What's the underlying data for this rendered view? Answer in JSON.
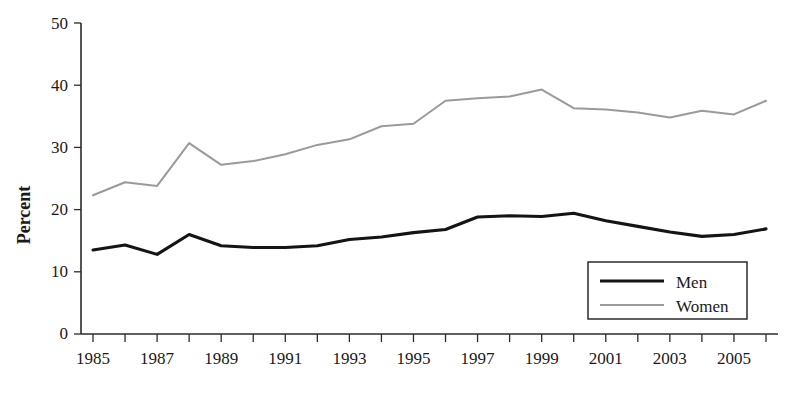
{
  "chart_data": {
    "type": "line",
    "title": "",
    "xlabel": "",
    "ylabel": "Percent",
    "x": [
      1985,
      1986,
      1987,
      1988,
      1989,
      1990,
      1991,
      1992,
      1993,
      1994,
      1995,
      1996,
      1997,
      1998,
      1999,
      2000,
      2001,
      2002,
      2003,
      2004,
      2005,
      2006
    ],
    "xlim": [
      1985,
      2006
    ],
    "ylim": [
      0,
      50
    ],
    "ytick_labels": [
      "0",
      "10",
      "20",
      "30",
      "40",
      "50"
    ],
    "yticks": [
      0,
      10,
      20,
      30,
      40,
      50
    ],
    "xtick_labels": [
      "1985",
      "1987",
      "1989",
      "1991",
      "1993",
      "1995",
      "1997",
      "1999",
      "2001",
      "2003",
      "2005"
    ],
    "xticks_labeled": [
      1985,
      1987,
      1989,
      1991,
      1993,
      1995,
      1997,
      1999,
      2001,
      2003,
      2005
    ],
    "xticks_minor": [
      1986,
      1988,
      1990,
      1992,
      1994,
      1996,
      1998,
      2000,
      2002,
      2004,
      2006
    ],
    "grid": false,
    "legend_position": "bottom-right",
    "series": [
      {
        "name": "Men",
        "color": "#141414",
        "values": [
          13.5,
          14.3,
          12.8,
          16.0,
          14.2,
          13.9,
          13.9,
          14.2,
          15.2,
          15.6,
          16.3,
          16.8,
          18.8,
          19.0,
          18.9,
          19.4,
          18.2,
          17.3,
          16.4,
          15.7,
          16.0,
          16.9
        ]
      },
      {
        "name": "Women",
        "color": "#9a9a9a",
        "values": [
          22.3,
          24.4,
          23.8,
          30.7,
          27.2,
          27.8,
          28.9,
          30.4,
          31.3,
          33.4,
          33.8,
          37.5,
          37.9,
          38.2,
          39.3,
          36.3,
          36.1,
          35.6,
          34.8,
          35.9,
          35.3,
          37.5
        ]
      }
    ]
  },
  "axis": {
    "y_title": "Percent"
  },
  "legend": {
    "items": [
      {
        "label": "Men",
        "style": "thick-black-line"
      },
      {
        "label": "Women",
        "style": "thin-gray-line"
      }
    ]
  }
}
